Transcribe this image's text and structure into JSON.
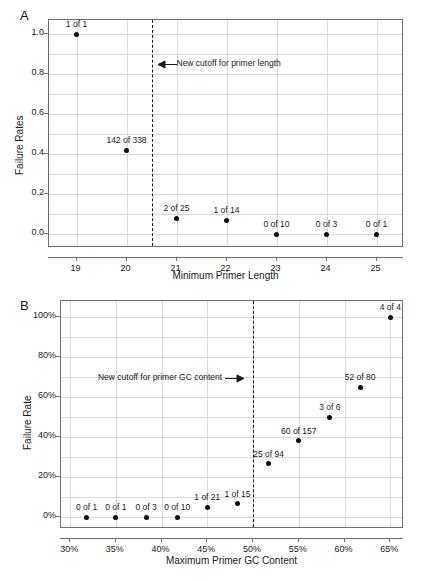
{
  "figure": {
    "panel_a_letter": "A",
    "panel_b_letter": "B"
  },
  "panel_a": {
    "xlabel": "Minimum Primer Length",
    "ylabel": "Failure Rates",
    "annotation": "New cutoff for primer length",
    "ytick_labels": [
      "0.0",
      "0.2",
      "0.4",
      "0.6",
      "0.8",
      "1.0"
    ],
    "xtick_labels": [
      "19",
      "20",
      "21",
      "22",
      "23",
      "24",
      "25"
    ],
    "point_labels": [
      "1 of 1",
      "142 of 338",
      "2 of 25",
      "1 of 14",
      "0 of 10",
      "0 of 3",
      "0 of 1"
    ]
  },
  "panel_b": {
    "xlabel": "Maximum Primer GC Content",
    "ylabel": "Failure Rate",
    "annotation": "New cutoff for primer GC content",
    "ytick_labels": [
      "0%",
      "20%",
      "40%",
      "60%",
      "80%",
      "100%"
    ],
    "xtick_labels": [
      "30%",
      "35%",
      "40%",
      "45%",
      "50%",
      "55%",
      "60%",
      "65%"
    ],
    "point_labels": [
      "0 of 1",
      "0 of 1",
      "0 of 3",
      "0 of 10",
      "1 of 21",
      "1 of 15",
      "25 of 94",
      "60 of 157",
      "3 of 6",
      "52 of 80",
      "4 of 4"
    ]
  },
  "chart_data": [
    {
      "type": "scatter",
      "panel": "A",
      "title": "",
      "xlabel": "Minimum Primer Length",
      "ylabel": "Failure Rates",
      "xlim": [
        18.45,
        25.55
      ],
      "ylim": [
        -0.07,
        1.07
      ],
      "xticks": [
        19,
        20,
        21,
        22,
        23,
        24,
        25
      ],
      "xtick_labels": [
        "19",
        "20",
        "21",
        "22",
        "23",
        "24",
        "25"
      ],
      "yticks": [
        0.0,
        0.2,
        0.4,
        0.6,
        0.8,
        1.0
      ],
      "ytick_labels": [
        "0.0",
        "0.2",
        "0.4",
        "0.6",
        "0.8",
        "1.0"
      ],
      "grid": true,
      "grid_minor_y_step": 0.1,
      "legend": "none",
      "cutoff_line": {
        "x": 20.5,
        "style": "dashed",
        "label": "New cutoff for primer length",
        "label_y": 0.845,
        "arrow": "left"
      },
      "x": [
        19,
        20,
        21,
        22,
        23,
        24,
        25
      ],
      "y": [
        1.0,
        0.42,
        0.08,
        0.07,
        0.0,
        0.0,
        0.0
      ],
      "point_labels": [
        "1 of 1",
        "142 of 338",
        "2 of 25",
        "1 of 14",
        "0 of 10",
        "0 of 3",
        "0 of 1"
      ],
      "failures": [
        1,
        142,
        2,
        1,
        0,
        0,
        0
      ],
      "totals": [
        1,
        338,
        25,
        14,
        10,
        3,
        1
      ]
    },
    {
      "type": "scatter",
      "panel": "B",
      "title": "",
      "xlabel": "Maximum Primer GC Content",
      "ylabel": "Failure Rate",
      "xlim": [
        29.0,
        66.5
      ],
      "ylim": [
        -0.06,
        1.08
      ],
      "xticks": [
        30,
        35,
        40,
        45,
        50,
        55,
        60,
        65
      ],
      "xtick_labels": [
        "30%",
        "35%",
        "40%",
        "45%",
        "50%",
        "55%",
        "60%",
        "65%"
      ],
      "yticks": [
        0.0,
        0.2,
        0.4,
        0.6,
        0.8,
        1.0
      ],
      "ytick_labels": [
        "0%",
        "20%",
        "40%",
        "60%",
        "80%",
        "100%"
      ],
      "grid": true,
      "grid_minor_y_step": 0.1,
      "legend": "none",
      "cutoff_line": {
        "x": 50,
        "style": "dashed",
        "label": "New cutoff for primer GC content",
        "label_y": 0.69,
        "arrow": "right"
      },
      "x": [
        31.8,
        35.0,
        38.3,
        41.7,
        45.0,
        48.3,
        51.7,
        55.0,
        58.4,
        61.7,
        65.0
      ],
      "y": [
        0.0,
        0.0,
        0.0,
        0.0,
        0.048,
        0.067,
        0.266,
        0.382,
        0.5,
        0.65,
        1.0
      ],
      "point_labels": [
        "0 of 1",
        "0 of 1",
        "0 of 3",
        "0 of 10",
        "1 of 21",
        "1 of 15",
        "25 of 94",
        "60 of 157",
        "3 of 6",
        "52 of 80",
        "4 of 4"
      ],
      "failures": [
        0,
        0,
        0,
        0,
        1,
        1,
        25,
        60,
        3,
        52,
        4
      ],
      "totals": [
        1,
        1,
        3,
        10,
        21,
        15,
        94,
        157,
        6,
        80,
        4
      ]
    }
  ],
  "colors": {
    "point": "#0d0d0d",
    "grid": "#d8d8d8",
    "axis": "#6f6f6f",
    "text": "#1a1a1a",
    "background": "#ffffff"
  }
}
